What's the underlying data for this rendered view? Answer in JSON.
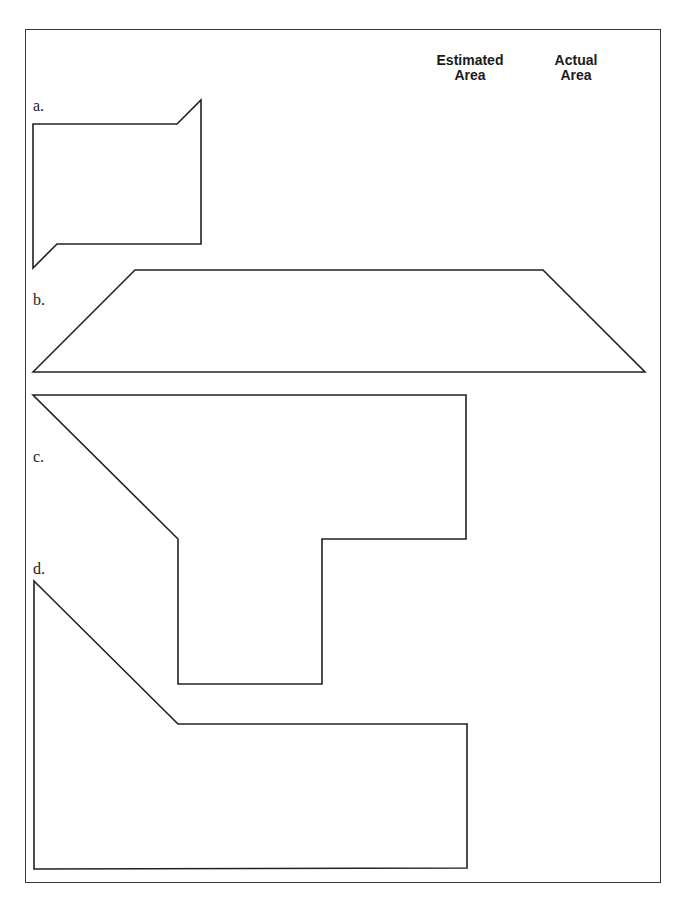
{
  "worksheet": {
    "columns": {
      "estimated": {
        "line1": "Estimated",
        "line2": "Area"
      },
      "actual": {
        "line1": "Actual",
        "line2": "Area"
      }
    },
    "problems": [
      {
        "label": "a.",
        "shape": "parallelogram-notched rectangle",
        "points": "33,124 177,124 201,100 201,244 57,244 33,268"
      },
      {
        "label": "b.",
        "shape": "trapezoid",
        "points": "33,372 135,270 543,270 645,372"
      },
      {
        "label": "c.",
        "shape": "T-shaped polygon",
        "points": "33,395 466,395 466,539 322,539 322,684 178,684 178,539"
      },
      {
        "label": "d.",
        "shape": "L-shaped polygon",
        "points": "34,581 178,724 467,724 467,868 34,869"
      }
    ]
  }
}
